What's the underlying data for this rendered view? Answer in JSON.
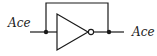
{
  "diagram": {
    "type": "logic-gate",
    "gate": "NOT (inverter)",
    "input_label": "Ace",
    "output_label": "Ace",
    "feedback_wire": true,
    "colors": {
      "stroke": "#1a1a1a",
      "background": "#ffffff"
    }
  }
}
